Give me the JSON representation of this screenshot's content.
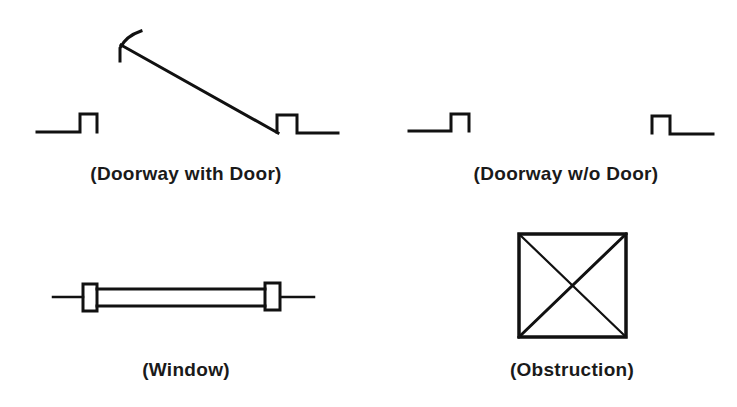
{
  "diagram": {
    "background": "#ffffff",
    "stroke_color": "#111111",
    "symbols": [
      {
        "id": "doorway-with-door",
        "label": "(Doorway with Door)",
        "icon": "doorway-with-door-icon"
      },
      {
        "id": "doorway-without-door",
        "label": "(Doorway w/o Door)",
        "icon": "doorway-without-door-icon"
      },
      {
        "id": "window",
        "label": "(Window)",
        "icon": "window-icon"
      },
      {
        "id": "obstruction",
        "label": "(Obstruction)",
        "icon": "obstruction-icon"
      }
    ]
  }
}
